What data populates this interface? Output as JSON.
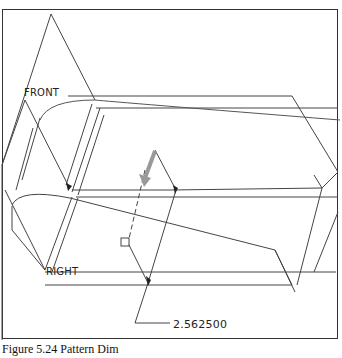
{
  "viewport": {
    "frame_color": "#333333",
    "line_color": "#444444",
    "highlight_color": "#9a9a9a"
  },
  "datum_labels": {
    "front": "FRONT",
    "right": "RIGHT"
  },
  "dimension": {
    "value": "2.562500"
  },
  "caption": {
    "text": "Figure 5.24 Pattern Dim"
  }
}
